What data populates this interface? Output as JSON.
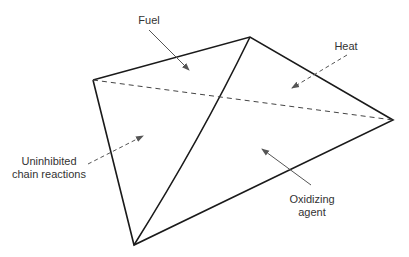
{
  "diagram": {
    "colors": {
      "line": "#1a1a1a",
      "arrow": "#555555",
      "text": "#333333",
      "background": "#ffffff"
    },
    "vertices": {
      "top": [
        250,
        37
      ],
      "left": [
        93,
        80
      ],
      "right": [
        393,
        120
      ],
      "bottom": [
        134,
        245
      ]
    },
    "labels": {
      "fuel": "Fuel",
      "heat": "Heat",
      "chain_line1": "Uninhibited",
      "chain_line2": "chain reactions",
      "oxidizing_line1": "Oxidizing",
      "oxidizing_line2": "agent"
    },
    "arrows": [
      {
        "name": "fuel",
        "from": [
          149,
          30
        ],
        "to": [
          189,
          70
        ],
        "style": "solid"
      },
      {
        "name": "heat",
        "from": [
          347,
          55
        ],
        "to": [
          292,
          88
        ],
        "style": "dashed"
      },
      {
        "name": "chain-reactions",
        "from": [
          88,
          164
        ],
        "to": [
          143,
          136
        ],
        "style": "dashed"
      },
      {
        "name": "oxidizing-agent",
        "from": [
          311,
          185
        ],
        "to": [
          262,
          149
        ],
        "style": "solid"
      }
    ]
  }
}
